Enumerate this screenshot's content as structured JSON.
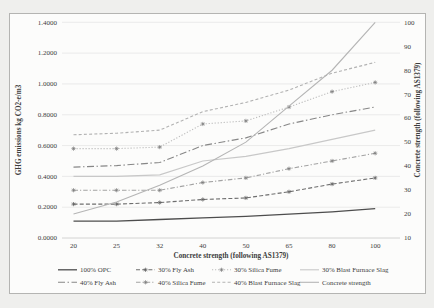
{
  "chart_data": {
    "type": "line",
    "title": "",
    "x_axis": {
      "title": "Concrete strength (following AS1379)",
      "tick_labels": [
        "20",
        "25",
        "32",
        "40",
        "50",
        "65",
        "80",
        "100"
      ]
    },
    "left_axis": {
      "title": "GHG emissions kg CO2-e/m3",
      "min": 0.0,
      "max": 1.4,
      "tick_labels": [
        "0.0000",
        "0.2000",
        "0.4000",
        "0.6000",
        "0.8000",
        "1.0000",
        "1.2000",
        "1.4000"
      ]
    },
    "right_axis": {
      "title": "Concrete strength (following AS1379)",
      "min": 10,
      "max": 100,
      "tick_labels": [
        "10",
        "20",
        "30",
        "40",
        "50",
        "60",
        "70",
        "80",
        "90",
        "100"
      ]
    },
    "categories": [
      20,
      25,
      32,
      40,
      50,
      65,
      80,
      100
    ],
    "series": [
      {
        "name": "100% OPC",
        "axis": "left",
        "line_style": "solid",
        "color": "#4d4d4d",
        "marker": false,
        "marker_color": "#4d4d4d",
        "values": [
          0.11,
          0.11,
          0.12,
          0.13,
          0.14,
          0.155,
          0.17,
          0.19
        ]
      },
      {
        "name": "30% Fly Ash",
        "axis": "left",
        "line_style": "dashed",
        "color": "#6e6e6e",
        "marker": true,
        "marker_color": "#5e5e5e",
        "values": [
          0.22,
          0.22,
          0.23,
          0.25,
          0.26,
          0.3,
          0.35,
          0.39
        ]
      },
      {
        "name": "30% Silica Fume",
        "axis": "left",
        "line_style": "dotted",
        "color": "#bdbdbd",
        "marker": true,
        "marker_color": "#7c7c7c",
        "values": [
          0.58,
          0.58,
          0.59,
          0.74,
          0.76,
          0.85,
          0.95,
          1.01
        ]
      },
      {
        "name": "30% Blast Furnace Slag",
        "axis": "left",
        "line_style": "solid",
        "color": "#c8c8c8",
        "marker": false,
        "marker_color": "#c8c8c8",
        "values": [
          0.4,
          0.4,
          0.41,
          0.5,
          0.53,
          0.58,
          0.64,
          0.7
        ]
      },
      {
        "name": "40% Fly Ash",
        "axis": "left",
        "line_style": "dash-dot-long",
        "color": "#878787",
        "marker": false,
        "marker_color": "#878787",
        "values": [
          0.46,
          0.47,
          0.49,
          0.6,
          0.65,
          0.74,
          0.8,
          0.85
        ]
      },
      {
        "name": "40% Silica Fume",
        "axis": "left",
        "line_style": "dash-dot",
        "color": "#a3a3a3",
        "marker": true,
        "marker_color": "#7c7c7c",
        "values": [
          0.31,
          0.31,
          0.31,
          0.36,
          0.39,
          0.45,
          0.5,
          0.55
        ]
      },
      {
        "name": "40% Blast Furnace Slag",
        "axis": "left",
        "line_style": "dashed-sm",
        "color": "#b2b2b2",
        "marker": false,
        "marker_color": "#b2b2b2",
        "values": [
          0.67,
          0.68,
          0.7,
          0.82,
          0.88,
          0.96,
          1.07,
          1.14
        ]
      },
      {
        "name": "Concrete strength",
        "axis": "right",
        "line_style": "solid",
        "color": "#b5b5b5",
        "marker": false,
        "marker_color": "#b5b5b5",
        "values": [
          20,
          25,
          32,
          40,
          50,
          65,
          80,
          100
        ]
      }
    ],
    "legend": {
      "rows": [
        [
          "100% OPC",
          "30% Fly Ash",
          "30% Silica Fume",
          "30% Blast Furnace Slag"
        ],
        [
          "40% Fly Ash",
          "40% Silica Fume",
          "40% Blast Furnace Slag",
          "Concrete strength"
        ]
      ]
    },
    "grid": "horizontal",
    "legend_position": "bottom"
  }
}
